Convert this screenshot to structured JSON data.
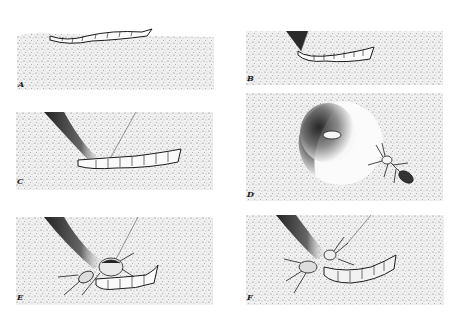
{
  "plate": {
    "background": "#ffffff",
    "ink": "#1a1a1a",
    "ground_tone": "#d8d8d8",
    "panels": [
      {
        "id": "A",
        "label": "A",
        "scene": "larva resting on ground surface"
      },
      {
        "id": "B",
        "label": "B",
        "scene": "larva seized at burrow entrance by insect"
      },
      {
        "id": "C",
        "label": "C",
        "scene": "larva emerging from angled burrow"
      },
      {
        "id": "D",
        "label": "D",
        "scene": "top view of pit with larva head and ant-like wasp at edge"
      },
      {
        "id": "E",
        "label": "E",
        "scene": "beetle-like insect grasping larva at burrow mouth"
      },
      {
        "id": "F",
        "label": "F",
        "scene": "insect pulling larva from burrow"
      }
    ]
  }
}
